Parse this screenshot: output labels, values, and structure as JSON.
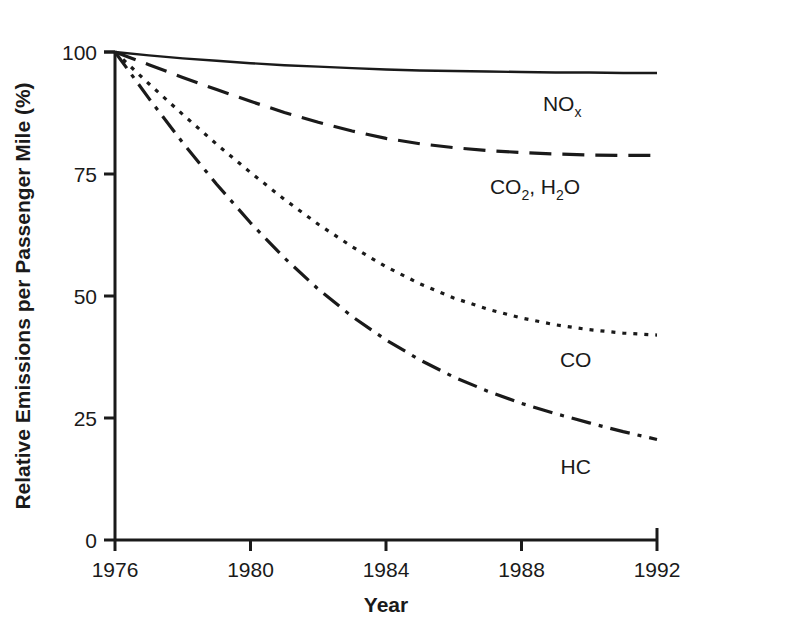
{
  "chart_data": {
    "type": "line",
    "title": "",
    "xlabel": "Year",
    "ylabel": "Relative Emissions per Passenger Mile (%)",
    "xlim": [
      1976,
      1992
    ],
    "ylim": [
      0,
      100
    ],
    "xticks": [
      1976,
      1980,
      1984,
      1988,
      1992
    ],
    "xtick_labels": [
      "1976",
      "1980",
      "1984",
      "1988",
      "1992"
    ],
    "yticks": [
      0,
      25,
      50,
      75,
      100
    ],
    "ytick_labels": [
      "0",
      "25",
      "50",
      "75",
      "100"
    ],
    "grid": false,
    "legend_position": "inline-right-of-curve",
    "x": [
      1976,
      1977,
      1978,
      1979,
      1980,
      1981,
      1982,
      1983,
      1984,
      1985,
      1986,
      1987,
      1988,
      1989,
      1990,
      1991,
      1992
    ],
    "series": [
      {
        "name": "NOx",
        "label_main": "NO",
        "label_sub": "x",
        "linestyle": "solid",
        "color": "#1a1a1a",
        "label_x": 1989.2,
        "label_y": 88,
        "values": [
          100,
          99.3,
          98.7,
          98.2,
          97.7,
          97.3,
          97.0,
          96.7,
          96.4,
          96.2,
          96.1,
          96.0,
          95.9,
          95.8,
          95.8,
          95.7,
          95.7
        ]
      },
      {
        "name": "CO2, H2O",
        "label_main": "CO",
        "label_sub": "2",
        "label_main2": ", H",
        "label_sub2": "2",
        "label_main3": "O",
        "linestyle": "dashed",
        "color": "#1a1a1a",
        "label_x": 1988.4,
        "label_y": 71,
        "values": [
          100,
          97.4,
          94.8,
          92.3,
          89.9,
          87.6,
          85.6,
          83.8,
          82.3,
          81.2,
          80.4,
          79.8,
          79.4,
          79.1,
          78.9,
          78.8,
          78.8
        ]
      },
      {
        "name": "CO",
        "label_main": "CO",
        "linestyle": "dotted",
        "color": "#1a1a1a",
        "label_x": 1989.6,
        "label_y": 35.5,
        "values": [
          100,
          93.5,
          87.2,
          81.1,
          75.3,
          69.8,
          64.7,
          60.1,
          56.0,
          52.5,
          49.6,
          47.3,
          45.5,
          44.1,
          43.1,
          42.4,
          42.0
        ]
      },
      {
        "name": "HC",
        "label_main": "HC",
        "linestyle": "dashdot",
        "color": "#1a1a1a",
        "label_x": 1989.6,
        "label_y": 13.5,
        "values": [
          100,
          90.5,
          81.4,
          72.9,
          65.0,
          57.8,
          51.4,
          45.8,
          41.0,
          36.9,
          33.4,
          30.5,
          28.0,
          25.9,
          24.0,
          22.2,
          20.6
        ]
      }
    ]
  },
  "axes": {
    "x_axis_name": "x-axis",
    "y_axis_name": "y-axis"
  }
}
